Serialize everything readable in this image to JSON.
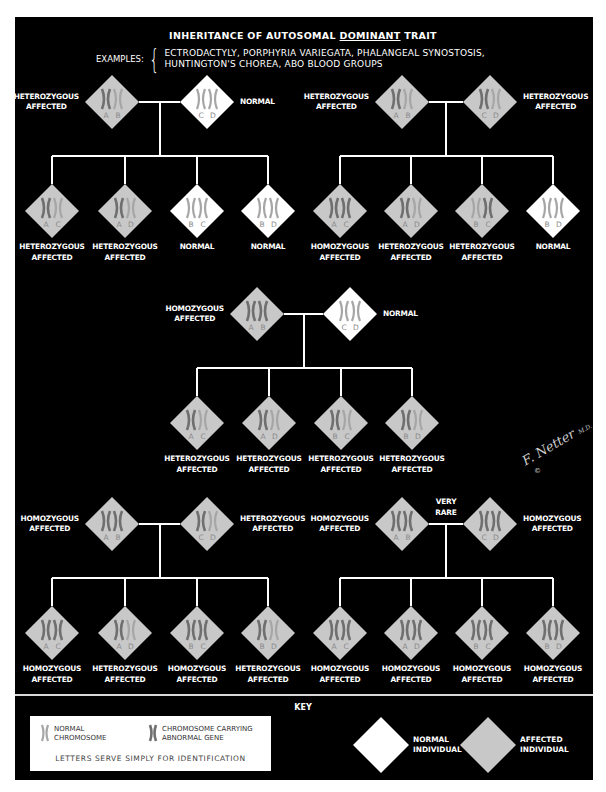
{
  "title": {
    "prefix": "INHERITANCE OF AUTOSOMAL ",
    "emphasis": "DOMINANT",
    "suffix": " TRAIT"
  },
  "examples": {
    "label": "EXAMPLES:",
    "lines": [
      "ECTRODACTYLY, PORPHYRIA VARIEGATA, PHALANGEAL SYNOSTOSIS,",
      "HUNTINGTON'S CHOREA, ABO BLOOD GROUPS"
    ]
  },
  "colors": {
    "background": "#000000",
    "affected_fill": "#c8c8c8",
    "normal_fill": "#ffffff",
    "normal_chromosome": "#a6a6a6",
    "abnormal_chromosome": "#6f6f6f",
    "line": "#ffffff"
  },
  "pedigrees": [
    {
      "id": "p1",
      "parents": [
        {
          "label": [
            "HETEROZYGOUS",
            "AFFECTED"
          ],
          "letters": [
            "A",
            "B"
          ],
          "affected": true,
          "abnormal": [
            true,
            false
          ]
        },
        {
          "label": [
            "NORMAL"
          ],
          "letters": [
            "C",
            "D"
          ],
          "affected": false,
          "abnormal": [
            false,
            false
          ]
        }
      ],
      "note": "",
      "children": [
        {
          "label": [
            "HETEROZYGOUS",
            "AFFECTED"
          ],
          "letters": [
            "A",
            "C"
          ],
          "affected": true,
          "abnormal": [
            true,
            false
          ]
        },
        {
          "label": [
            "HETEROZYGOUS",
            "AFFECTED"
          ],
          "letters": [
            "A",
            "D"
          ],
          "affected": true,
          "abnormal": [
            true,
            false
          ]
        },
        {
          "label": [
            "NORMAL"
          ],
          "letters": [
            "B",
            "C"
          ],
          "affected": false,
          "abnormal": [
            false,
            false
          ]
        },
        {
          "label": [
            "NORMAL"
          ],
          "letters": [
            "B",
            "D"
          ],
          "affected": false,
          "abnormal": [
            false,
            false
          ]
        }
      ]
    },
    {
      "id": "p2",
      "parents": [
        {
          "label": [
            "HETEROZYGOUS",
            "AFFECTED"
          ],
          "letters": [
            "A",
            "B"
          ],
          "affected": true,
          "abnormal": [
            true,
            false
          ]
        },
        {
          "label": [
            "HETEROZYGOUS",
            "AFFECTED"
          ],
          "letters": [
            "C",
            "D"
          ],
          "affected": true,
          "abnormal": [
            true,
            false
          ]
        }
      ],
      "note": "",
      "children": [
        {
          "label": [
            "HOMOZYGOUS",
            "AFFECTED"
          ],
          "letters": [
            "A",
            "C"
          ],
          "affected": true,
          "abnormal": [
            true,
            true
          ]
        },
        {
          "label": [
            "HETEROZYGOUS",
            "AFFECTED"
          ],
          "letters": [
            "A",
            "D"
          ],
          "affected": true,
          "abnormal": [
            true,
            false
          ]
        },
        {
          "label": [
            "HETEROZYGOUS",
            "AFFECTED"
          ],
          "letters": [
            "B",
            "C"
          ],
          "affected": true,
          "abnormal": [
            false,
            true
          ]
        },
        {
          "label": [
            "NORMAL"
          ],
          "letters": [
            "B",
            "D"
          ],
          "affected": false,
          "abnormal": [
            false,
            false
          ]
        }
      ]
    },
    {
      "id": "p3",
      "parents": [
        {
          "label": [
            "HOMOZYGOUS",
            "AFFECTED"
          ],
          "letters": [
            "A",
            "B"
          ],
          "affected": true,
          "abnormal": [
            true,
            true
          ]
        },
        {
          "label": [
            "NORMAL"
          ],
          "letters": [
            "C",
            "D"
          ],
          "affected": false,
          "abnormal": [
            false,
            false
          ]
        }
      ],
      "note": "",
      "children": [
        {
          "label": [
            "HETEROZYGOUS",
            "AFFECTED"
          ],
          "letters": [
            "A",
            "C"
          ],
          "affected": true,
          "abnormal": [
            true,
            false
          ]
        },
        {
          "label": [
            "HETEROZYGOUS",
            "AFFECTED"
          ],
          "letters": [
            "A",
            "D"
          ],
          "affected": true,
          "abnormal": [
            true,
            false
          ]
        },
        {
          "label": [
            "HETEROZYGOUS",
            "AFFECTED"
          ],
          "letters": [
            "B",
            "C"
          ],
          "affected": true,
          "abnormal": [
            true,
            false
          ]
        },
        {
          "label": [
            "HETEROZYGOUS",
            "AFFECTED"
          ],
          "letters": [
            "B",
            "D"
          ],
          "affected": true,
          "abnormal": [
            true,
            false
          ]
        }
      ]
    },
    {
      "id": "p4",
      "parents": [
        {
          "label": [
            "HOMOZYGOUS",
            "AFFECTED"
          ],
          "letters": [
            "A",
            "B"
          ],
          "affected": true,
          "abnormal": [
            true,
            true
          ]
        },
        {
          "label": [
            "HETEROZYGOUS",
            "AFFECTED"
          ],
          "letters": [
            "C",
            "D"
          ],
          "affected": true,
          "abnormal": [
            true,
            false
          ]
        }
      ],
      "note": "",
      "children": [
        {
          "label": [
            "HOMOZYGOUS",
            "AFFECTED"
          ],
          "letters": [
            "A",
            "C"
          ],
          "affected": true,
          "abnormal": [
            true,
            true
          ]
        },
        {
          "label": [
            "HETEROZYGOUS",
            "AFFECTED"
          ],
          "letters": [
            "A",
            "D"
          ],
          "affected": true,
          "abnormal": [
            true,
            false
          ]
        },
        {
          "label": [
            "HOMOZYGOUS",
            "AFFECTED"
          ],
          "letters": [
            "B",
            "C"
          ],
          "affected": true,
          "abnormal": [
            true,
            true
          ]
        },
        {
          "label": [
            "HETEROZYGOUS",
            "AFFECTED"
          ],
          "letters": [
            "B",
            "D"
          ],
          "affected": true,
          "abnormal": [
            true,
            false
          ]
        }
      ]
    },
    {
      "id": "p5",
      "parents": [
        {
          "label": [
            "HOMOZYGOUS",
            "AFFECTED"
          ],
          "letters": [
            "A",
            "B"
          ],
          "affected": true,
          "abnormal": [
            true,
            true
          ]
        },
        {
          "label": [
            "HOMOZYGOUS",
            "AFFECTED"
          ],
          "letters": [
            "C",
            "D"
          ],
          "affected": true,
          "abnormal": [
            true,
            true
          ]
        }
      ],
      "note": [
        "VERY",
        "RARE"
      ],
      "children": [
        {
          "label": [
            "HOMOZYGOUS",
            "AFFECTED"
          ],
          "letters": [
            "A",
            "C"
          ],
          "affected": true,
          "abnormal": [
            true,
            true
          ]
        },
        {
          "label": [
            "HOMOZYGOUS",
            "AFFECTED"
          ],
          "letters": [
            "A",
            "D"
          ],
          "affected": true,
          "abnormal": [
            true,
            true
          ]
        },
        {
          "label": [
            "HOMOZYGOUS",
            "AFFECTED"
          ],
          "letters": [
            "B",
            "C"
          ],
          "affected": true,
          "abnormal": [
            true,
            true
          ]
        },
        {
          "label": [
            "HOMOZYGOUS",
            "AFFECTED"
          ],
          "letters": [
            "B",
            "D"
          ],
          "affected": true,
          "abnormal": [
            true,
            true
          ]
        }
      ]
    }
  ],
  "signature": {
    "name": "F. Netter",
    "suffix": "M.D.",
    "copyright": "©"
  },
  "key": {
    "title": "KEY",
    "normal_chromosome": [
      "NORMAL",
      "CHROMOSOME"
    ],
    "abnormal_chromosome": [
      "CHROMOSOME CARRYING",
      "ABNORMAL GENE"
    ],
    "note": "LETTERS SERVE SIMPLY FOR IDENTIFICATION",
    "normal_individual": [
      "NORMAL",
      "INDIVIDUAL"
    ],
    "affected_individual": [
      "AFFECTED",
      "INDIVIDUAL"
    ]
  }
}
